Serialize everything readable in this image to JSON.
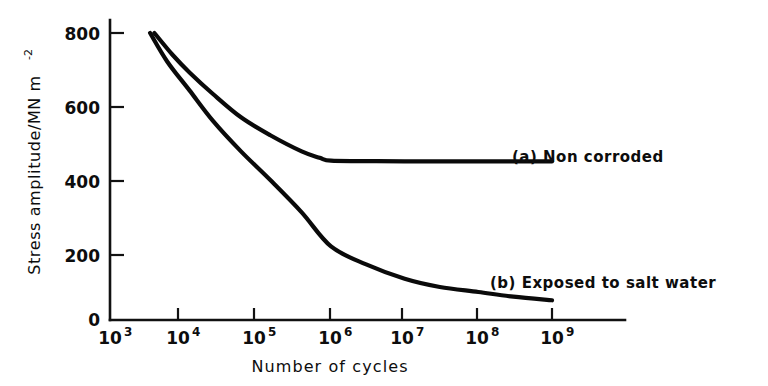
{
  "figure": {
    "background_color": "#ffffff",
    "ink_color": "#0a0a0a"
  },
  "chart_data": {
    "type": "line",
    "title": "",
    "subtitle": "",
    "xlabel": "Number of cycles",
    "ylabel": "Stress amplitude/MN m",
    "ylabel_superscript": "-2",
    "x_scale": "log10",
    "xlim": [
      1000,
      1000000000
    ],
    "ylim": [
      0,
      860
    ],
    "grid": false,
    "legend_position": "inline-right-of-curves",
    "x_ticks": [
      {
        "base": "10",
        "exponent": "3",
        "value": 1000
      },
      {
        "base": "10",
        "exponent": "4",
        "value": 10000
      },
      {
        "base": "10",
        "exponent": "5",
        "value": 100000
      },
      {
        "base": "10",
        "exponent": "6",
        "value": 1000000
      },
      {
        "base": "10",
        "exponent": "7",
        "value": 10000000
      },
      {
        "base": "10",
        "exponent": "8",
        "value": 100000000
      },
      {
        "base": "10",
        "exponent": "9",
        "value": 1000000000
      }
    ],
    "y_ticks": [
      {
        "label": "0",
        "value": 0
      },
      {
        "label": "200",
        "value": 200
      },
      {
        "label": "400",
        "value": 400
      },
      {
        "label": "600",
        "value": 600
      },
      {
        "label": "800",
        "value": 800
      }
    ],
    "series": [
      {
        "name": "(a) Non corroded",
        "label": "(a) Non corroded",
        "x": [
          4000,
          7000,
          12000,
          25000,
          60000,
          150000,
          400000,
          700000,
          1000000,
          3000000,
          10000000,
          100000000,
          1000000000
        ],
        "values": [
          800,
          740,
          690,
          630,
          565,
          515,
          470,
          452,
          444,
          443,
          442,
          442,
          442
        ]
      },
      {
        "name": "(b) Exposed to salt water",
        "label": "(b) Exposed to salt water",
        "x": [
          3500,
          6000,
          12000,
          25000,
          60000,
          150000,
          400000,
          1000000,
          3000000,
          10000000,
          30000000,
          100000000,
          300000000,
          1000000000
        ],
        "values": [
          800,
          720,
          640,
          555,
          470,
          390,
          300,
          205,
          155,
          115,
          92,
          78,
          65,
          55
        ]
      }
    ],
    "annotations": [
      {
        "text": "(a) Non corroded",
        "anchor_x": 10000000,
        "anchor_y": 460
      },
      {
        "text": "(b) Exposed to salt water",
        "anchor_x": 30000000,
        "anchor_y": 150
      }
    ]
  }
}
